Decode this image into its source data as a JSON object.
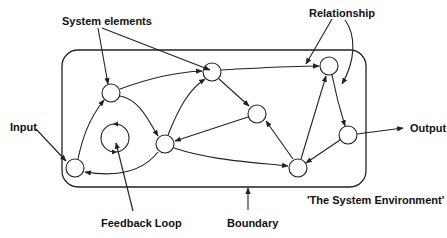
{
  "diagram": {
    "type": "system-diagram",
    "labels": {
      "system_elements": "System elements",
      "relationship": "Relationship",
      "input": "Input",
      "output": "Output",
      "feedback_loop": "Feedback Loop",
      "boundary": "Boundary",
      "environment": "'The System Environment'"
    },
    "nodes": [
      {
        "id": "A",
        "role": "input-element"
      },
      {
        "id": "B",
        "role": "element"
      },
      {
        "id": "L",
        "role": "feedback-loop"
      },
      {
        "id": "C",
        "role": "element"
      },
      {
        "id": "D",
        "role": "element"
      },
      {
        "id": "E",
        "role": "element"
      },
      {
        "id": "F",
        "role": "element"
      },
      {
        "id": "G",
        "role": "output-element"
      },
      {
        "id": "H",
        "role": "element"
      }
    ],
    "edges": [
      {
        "from": "A",
        "to": "B"
      },
      {
        "from": "B",
        "to": "D"
      },
      {
        "from": "B",
        "to": "C"
      },
      {
        "from": "C",
        "to": "D"
      },
      {
        "from": "C",
        "to": "A"
      },
      {
        "from": "D",
        "to": "F"
      },
      {
        "from": "D",
        "to": "E"
      },
      {
        "from": "E",
        "to": "C"
      },
      {
        "from": "C",
        "to": "H"
      },
      {
        "from": "H",
        "to": "E"
      },
      {
        "from": "H",
        "to": "F"
      },
      {
        "from": "F",
        "to": "G"
      },
      {
        "from": "G",
        "to": "H"
      }
    ]
  }
}
